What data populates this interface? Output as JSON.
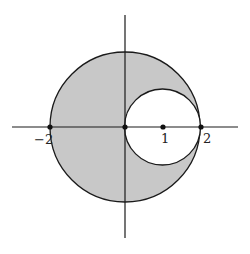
{
  "diagram": {
    "colors": {
      "fill": "#c8c8c8",
      "stroke": "#1a1a1a",
      "background": "#ffffff"
    },
    "big_circle": {
      "center": [
        0,
        0
      ],
      "radius": 2
    },
    "small_circle": {
      "center": [
        1,
        0
      ],
      "radius": 1
    },
    "points": [
      {
        "x": -2,
        "label": "−2"
      },
      {
        "x": 0,
        "label": ""
      },
      {
        "x": 1,
        "label": "1"
      },
      {
        "x": 2,
        "label": "2"
      }
    ],
    "labels": {
      "neg2": "−2",
      "one": "1",
      "two": "2"
    }
  }
}
